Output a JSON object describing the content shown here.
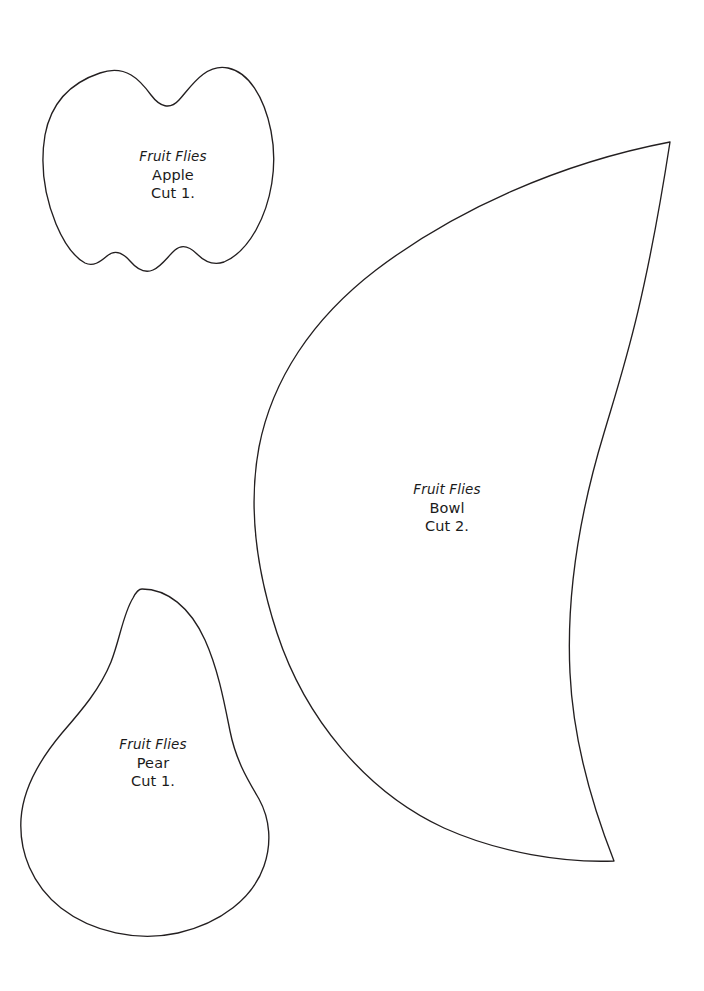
{
  "document": {
    "title": "Fruit Flies Sewing Pattern Templates",
    "type": "pattern-template-sheet",
    "page_width": 704,
    "page_height": 991,
    "background_color": "#ffffff",
    "outline_color": "#231f20",
    "text_color": "#1b1b1b"
  },
  "pieces": [
    {
      "id": "apple",
      "collection": "Fruit Flies",
      "name": "Apple",
      "cut_instruction": "Cut 1.",
      "shape": "apple-outline",
      "bounds": {
        "x": 43,
        "y": 66,
        "width": 229,
        "height": 208
      }
    },
    {
      "id": "bowl",
      "collection": "Fruit Flies",
      "name": "Bowl",
      "cut_instruction": "Cut 2.",
      "shape": "bowl-crescent-outline",
      "bounds": {
        "x": 255,
        "y": 141,
        "width": 415,
        "height": 720
      }
    },
    {
      "id": "pear",
      "collection": "Fruit Flies",
      "name": "Pear",
      "cut_instruction": "Cut 1.",
      "shape": "pear-outline",
      "bounds": {
        "x": 20,
        "y": 588,
        "width": 252,
        "height": 348
      }
    }
  ]
}
